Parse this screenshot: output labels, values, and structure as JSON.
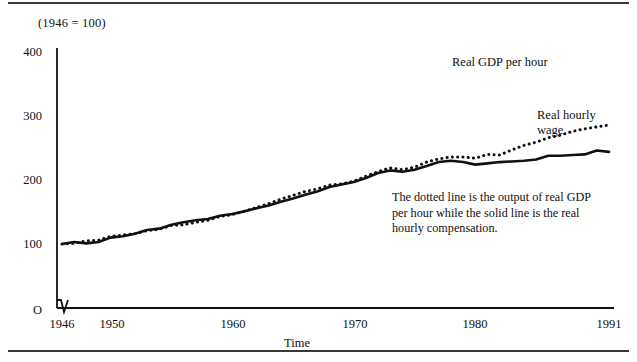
{
  "figure": {
    "title": "(1946 = 100)",
    "annotation": "The dotted line is the output of real GDP per hour while the solid line is the real hourly compensation.",
    "colors": {
      "ink": "#111111",
      "rule": "#3a3a3a",
      "background": "#ffffff"
    }
  },
  "labels": {
    "gdp": "Real GDP per hour",
    "wage_line1": "Real hourly",
    "wage_line2": "wage"
  },
  "chart_data": {
    "type": "line",
    "title": "(1946 = 100)",
    "xlabel": "Time",
    "ylabel": "",
    "xlim": [
      1946,
      1991
    ],
    "ylim": [
      0,
      400
    ],
    "grid": false,
    "legend_position": "inline-annotation",
    "y_axis_break": true,
    "xticks": [
      1946,
      1950,
      1960,
      1970,
      1980,
      1991
    ],
    "xtick_labels": [
      "1946",
      "1950",
      "1960",
      "1970",
      "1980",
      "1991"
    ],
    "yticks": [
      0,
      100,
      200,
      300,
      400
    ],
    "ytick_labels": [
      "O",
      "100",
      "200",
      "300",
      "400"
    ],
    "x": [
      1946,
      1947,
      1948,
      1949,
      1950,
      1951,
      1952,
      1953,
      1954,
      1955,
      1956,
      1957,
      1958,
      1959,
      1960,
      1961,
      1962,
      1963,
      1964,
      1965,
      1966,
      1967,
      1968,
      1969,
      1970,
      1971,
      1972,
      1973,
      1974,
      1975,
      1976,
      1977,
      1978,
      1979,
      1980,
      1981,
      1982,
      1983,
      1984,
      1985,
      1986,
      1987,
      1988,
      1989,
      1990,
      1991
    ],
    "series": [
      {
        "name": "Real GDP per hour",
        "style": "dotted",
        "values": [
          100,
          101,
          105,
          106,
          112,
          114,
          116,
          121,
          123,
          129,
          130,
          134,
          137,
          143,
          146,
          151,
          157,
          163,
          170,
          176,
          182,
          186,
          192,
          194,
          198,
          206,
          213,
          219,
          216,
          220,
          228,
          233,
          236,
          236,
          234,
          240,
          239,
          247,
          254,
          259,
          266,
          270,
          276,
          280,
          283,
          286
        ],
        "values_indexed_1946_100": true
      },
      {
        "name": "Real hourly wage",
        "style": "solid",
        "values": [
          100,
          103,
          101,
          103,
          110,
          112,
          116,
          122,
          124,
          130,
          134,
          137,
          139,
          144,
          147,
          151,
          156,
          160,
          166,
          171,
          177,
          182,
          189,
          193,
          197,
          203,
          211,
          215,
          213,
          216,
          222,
          228,
          230,
          228,
          224,
          226,
          228,
          229,
          230,
          232,
          238,
          238,
          239,
          240,
          246,
          244
        ],
        "values_indexed_1946_100": true
      }
    ]
  }
}
